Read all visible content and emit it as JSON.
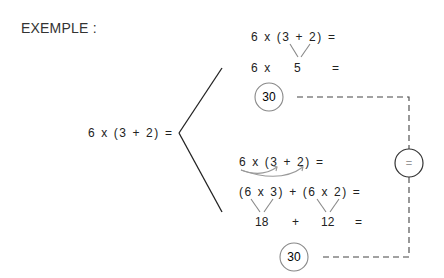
{
  "title": "EXEMPLE :",
  "root_expression": "6 x (3 + 2) =",
  "top_branch": {
    "line1": "6 x (3 + 2) =",
    "line2_left": "6 x",
    "line2_mid": "5",
    "line2_eq": "=",
    "result": "30"
  },
  "bottom_branch": {
    "line1": "6 x (3 + 2) =",
    "line2": "(6 x 3) + (6 x 2) =",
    "line3_a": "18",
    "line3_op": "+",
    "line3_b": "12",
    "line3_eq": "=",
    "result": "30"
  },
  "equality_symbol": "=",
  "colors": {
    "text": "#222222",
    "lines": "#222222",
    "arrows": "#999999",
    "circle_stroke": "#888888",
    "dash": "#444444"
  }
}
